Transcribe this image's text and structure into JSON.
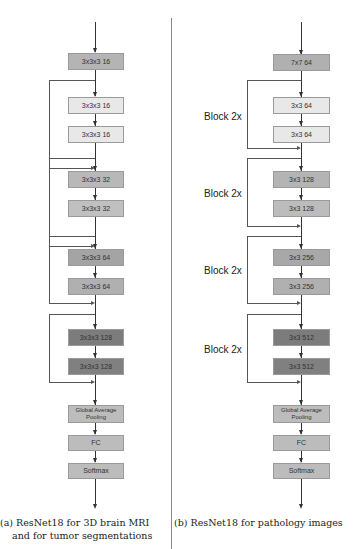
{
  "panel_a": {
    "caption_line1": "(a) ResNet18 for 3D brain MRI",
    "caption_line2": "and for tumor segmentations",
    "layers": [
      {
        "label": "3x3x3 16",
        "color": "#b4b4b4"
      },
      {
        "label": "3x3x3 16",
        "color": "#e8e8e8"
      },
      {
        "label": "3x3x3 16",
        "color": "#e8e8e8"
      },
      {
        "label": "3x3x3 32",
        "color": "#b8b8b8"
      },
      {
        "label": "3x3x3 32",
        "color": "#c0c0c0"
      },
      {
        "label": "3x3x3 64",
        "color": "#a4a4a4"
      },
      {
        "label": "3x3x3 64",
        "color": "#b0b0b0"
      },
      {
        "label": "3x3x3 128",
        "color": "#7c7c7c"
      },
      {
        "label": "3x3x3 128",
        "color": "#808080"
      },
      {
        "label": "Global Average Pooling",
        "color": "#bcbcbc"
      },
      {
        "label": "FC",
        "color": "#bcbcbc"
      },
      {
        "label": "Softmax",
        "color": "#bcbcbc"
      }
    ]
  },
  "panel_b": {
    "caption_line1": "(b) ResNet18 for pathology images",
    "block_labels": [
      "Block 2x",
      "Block 2x",
      "Block 2x",
      "Block 2x"
    ],
    "layers": [
      {
        "label": "7x7 64",
        "color": "#b0b0b0"
      },
      {
        "label": "3x3 64",
        "color": "#e8e8e8"
      },
      {
        "label": "3x3 64",
        "color": "#e8e8e8"
      },
      {
        "label": "3x3 128",
        "color": "#b4b4b4"
      },
      {
        "label": "3x3 128",
        "color": "#bcbcbc"
      },
      {
        "label": "3x3 256",
        "color": "#a8a8a8"
      },
      {
        "label": "3x3 256",
        "color": "#b0b0b0"
      },
      {
        "label": "3x3 512",
        "color": "#7c7c7c"
      },
      {
        "label": "3x3 512",
        "color": "#808080"
      },
      {
        "label": "Global Average Pooling",
        "color": "#bcbcbc"
      },
      {
        "label": "FC",
        "color": "#bcbcbc"
      },
      {
        "label": "Softmax",
        "color": "#bcbcbc"
      }
    ]
  }
}
